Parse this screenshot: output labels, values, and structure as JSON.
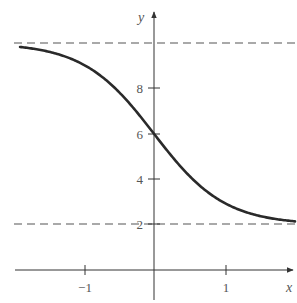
{
  "chart_data": {
    "type": "line",
    "title": "",
    "xlabel": "x",
    "ylabel": "y",
    "function": "y = 2 + 8/(1 + e^(2x))",
    "xlim": [
      -1.95,
      2.0
    ],
    "ylim": [
      0,
      10.5
    ],
    "grid": false,
    "legend": null,
    "x_ticks": [
      {
        "value": -1,
        "label": "−1"
      },
      {
        "value": 1,
        "label": "1"
      }
    ],
    "y_ticks": [
      {
        "value": 2,
        "label": "2"
      },
      {
        "value": 4,
        "label": "4"
      },
      {
        "value": 6,
        "label": "6"
      },
      {
        "value": 8,
        "label": "8"
      }
    ],
    "asymptotes": [
      {
        "y": 10,
        "style": "dashed"
      },
      {
        "y": 2,
        "style": "dashed"
      }
    ],
    "series": [
      {
        "name": "curve",
        "x": [
          -1.9,
          -1.5,
          -1.0,
          -0.5,
          0.0,
          0.5,
          1.0,
          1.5,
          2.0
        ],
        "y": [
          9.82,
          9.62,
          8.95,
          7.85,
          6.0,
          4.15,
          3.05,
          2.38,
          2.15
        ]
      }
    ]
  },
  "labels": {
    "x_axis": "x",
    "y_axis": "y",
    "tick_neg1": "−1",
    "tick_1": "1",
    "tick_2": "2",
    "tick_4": "4",
    "tick_6": "6",
    "tick_8": "8"
  }
}
